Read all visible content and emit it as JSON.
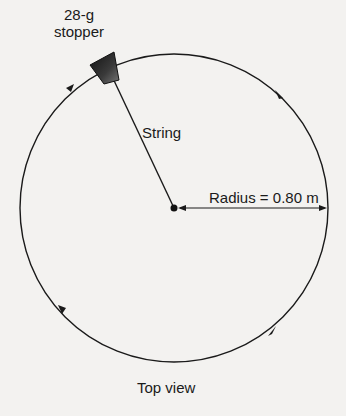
{
  "diagram": {
    "stopper_label_line1": "28-g",
    "stopper_label_line2": "stopper",
    "string_label": "String",
    "radius_label": "Radius = 0.80 m",
    "caption": "Top view",
    "circle": {
      "cx": 174,
      "cy": 208,
      "r": 154
    },
    "motion_direction": "clockwise",
    "colors": {
      "line": "#1a1a1a",
      "background": "#f3f2f0",
      "stopper": "#2a2a2a"
    }
  }
}
